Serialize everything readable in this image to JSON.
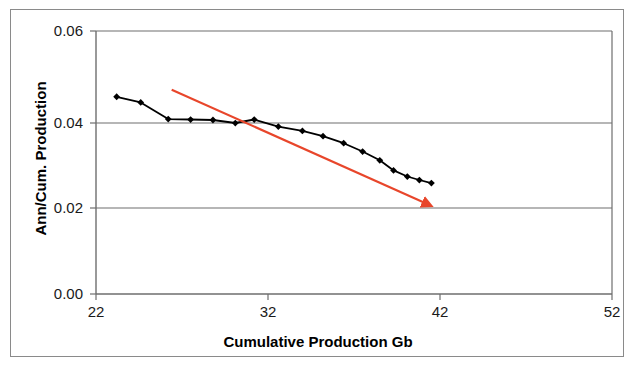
{
  "chart_data": {
    "type": "line",
    "title": "",
    "xlabel": "Cumulative Production Gb",
    "ylabel": "Ann/Cum. Production",
    "xlim": [
      22,
      52
    ],
    "ylim": [
      0.0,
      0.06
    ],
    "xticks": [
      "22",
      "32",
      "42",
      "52"
    ],
    "xtick_values": [
      22,
      32,
      42,
      52
    ],
    "yticks": [
      "0.00",
      "0.02",
      "0.04",
      "0.06"
    ],
    "ytick_values": [
      0.0,
      0.02,
      0.04,
      0.06
    ],
    "grid": "horizontal-gridlines-only",
    "legend": "none",
    "series": [
      {
        "name": "Ann/Cum. Production",
        "marker": "diamond",
        "color": "#000000",
        "x": [
          23.2,
          24.6,
          26.2,
          27.5,
          28.8,
          30.1,
          31.2,
          32.6,
          34.0,
          35.2,
          36.4,
          37.5,
          38.5,
          39.3,
          40.1,
          40.8,
          41.5
        ],
        "y": [
          0.045,
          0.0437,
          0.0399,
          0.0398,
          0.0397,
          0.039,
          0.0398,
          0.0382,
          0.0372,
          0.036,
          0.0344,
          0.0325,
          0.0305,
          0.0282,
          0.0268,
          0.026,
          0.0253
        ]
      }
    ],
    "annotations": [
      {
        "type": "trend-arrow",
        "color": "#E8462B",
        "x_start": 26.4,
        "y_start": 0.0466,
        "x_end": 41.1,
        "y_end": 0.0208,
        "arrowhead": "end"
      }
    ]
  },
  "axis": {
    "x_title": "Cumulative Production Gb",
    "y_title": "Ann/Cum. Production"
  },
  "colors": {
    "series_line": "#111111",
    "trend_arrow": "#E8462B",
    "gridline": "#6e6e6e",
    "frame": "#8a8a8a"
  }
}
